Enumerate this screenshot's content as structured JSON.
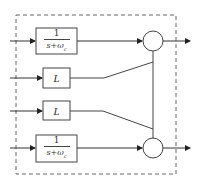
{
  "diagram": {
    "type": "block-diagram",
    "colors": {
      "line": "#444444",
      "frame": "#666666",
      "background": "#ffffff"
    },
    "frame": {
      "style": "dashed"
    },
    "blocks": [
      {
        "id": "tf-top",
        "numerator": "1",
        "denominator": "s+ω",
        "subscript": "c"
      },
      {
        "id": "gain-upper",
        "label": "L"
      },
      {
        "id": "gain-lower",
        "label": "L"
      },
      {
        "id": "tf-bottom",
        "numerator": "1",
        "denominator": "s+ω",
        "subscript": "c"
      }
    ],
    "summers": [
      {
        "id": "sum-top"
      },
      {
        "id": "sum-bottom"
      }
    ],
    "inputs": 4,
    "outputs": 2
  }
}
